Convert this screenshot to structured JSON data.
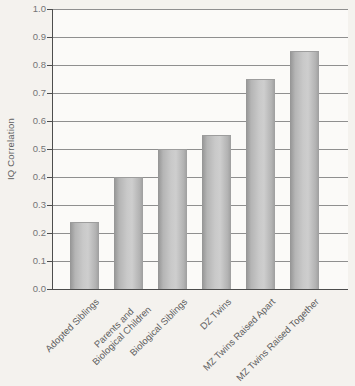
{
  "chart_data": {
    "type": "bar",
    "title": "",
    "xlabel": "",
    "ylabel": "IQ Correlation",
    "ylim": [
      0,
      1.0
    ],
    "ytick_step": 0.1,
    "yticks": [
      "1.0",
      "0.9",
      "0.8",
      "0.7",
      "0.6",
      "0.5",
      "0.4",
      "0.3",
      "0.2",
      "0.1",
      "0.0"
    ],
    "categories": [
      "Adopted Siblings",
      "Parents and\nBiological Children",
      "Biological Siblings",
      "DZ Twins",
      "MZ Twins Raised Apart",
      "MZ Twins Raised Together"
    ],
    "values": [
      0.24,
      0.4,
      0.5,
      0.55,
      0.75,
      0.85
    ],
    "grid": true,
    "legend": false,
    "category_label_rotation_deg": 45
  },
  "colors": {
    "background": "#f4f2ee",
    "plot_background": "#fbfaf8",
    "gridline": "#8f8f8f",
    "axis": "#4d4d4d",
    "tick_label": "#757575",
    "category_label": "#5f5f5f",
    "y_title": "#606060",
    "bar_edge_dark": "#949494",
    "bar_mid_light": "#cecece",
    "bar_right_dark": "#9e9e9e",
    "bar_top_rim": "#9d9d9d"
  }
}
